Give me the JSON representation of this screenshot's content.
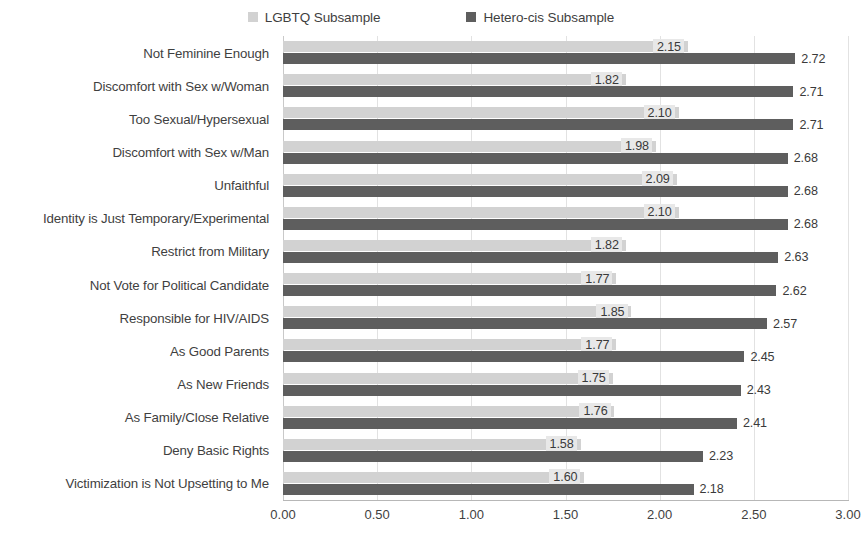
{
  "chart_data": {
    "type": "bar",
    "orientation": "horizontal",
    "title": "",
    "xlabel": "",
    "ylabel": "",
    "xlim": [
      0.0,
      3.0
    ],
    "xticks": [
      "0.00",
      "0.50",
      "1.00",
      "1.50",
      "2.00",
      "2.50",
      "3.00"
    ],
    "xtick_values": [
      0.0,
      0.5,
      1.0,
      1.5,
      2.0,
      2.5,
      3.0
    ],
    "grid": true,
    "legend_position": "top-center",
    "categories": [
      "Not Feminine Enough",
      "Discomfort with Sex w/Woman",
      "Too Sexual/Hypersexual",
      "Discomfort with Sex w/Man",
      "Unfaithful",
      "Identity is Just Temporary/Experimental",
      "Restrict from Military",
      "Not Vote for Political Candidate",
      "Responsible for HIV/AIDS",
      "As Good Parents",
      "As New Friends",
      "As Family/Close Relative",
      "Deny Basic Rights",
      "Victimization is Not Upsetting to Me"
    ],
    "series": [
      {
        "name": "LGBTQ Subsample",
        "color": "#d2d2d2",
        "values": [
          2.15,
          1.82,
          2.1,
          1.98,
          2.09,
          2.1,
          1.82,
          1.77,
          1.85,
          1.77,
          1.75,
          1.76,
          1.58,
          1.6
        ],
        "labels": [
          "2.15",
          "1.82",
          "2.10",
          "1.98",
          "2.09",
          "2.10",
          "1.82",
          "1.77",
          "1.85",
          "1.77",
          "1.75",
          "1.76",
          "1.58",
          "1.60"
        ]
      },
      {
        "name": "Hetero-cis Subsample",
        "color": "#5e5e5e",
        "values": [
          2.72,
          2.71,
          2.71,
          2.68,
          2.68,
          2.68,
          2.63,
          2.62,
          2.57,
          2.45,
          2.43,
          2.41,
          2.23,
          2.18
        ],
        "labels": [
          "2.72",
          "2.71",
          "2.71",
          "2.68",
          "2.68",
          "2.68",
          "2.63",
          "2.62",
          "2.57",
          "2.45",
          "2.43",
          "2.41",
          "2.23",
          "2.18"
        ]
      }
    ]
  },
  "legend": {
    "items": [
      {
        "label": "LGBTQ Subsample",
        "color": "#d2d2d2",
        "icon": "square-marker-icon"
      },
      {
        "label": "Hetero-cis Subsample",
        "color": "#5e5e5e",
        "icon": "square-marker-icon"
      }
    ]
  }
}
